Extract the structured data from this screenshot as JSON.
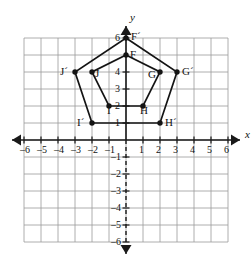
{
  "chart_data": {
    "type": "scatter",
    "title": "",
    "xlabel": "x",
    "ylabel": "y",
    "xlim": [
      -6,
      6
    ],
    "ylim": [
      -6,
      6
    ],
    "grid": true,
    "legend": "none",
    "x_ticks": [
      -6,
      -5,
      -4,
      -3,
      -2,
      -1,
      1,
      2,
      3,
      4,
      5,
      6
    ],
    "y_ticks": [
      6,
      4,
      3,
      2,
      1,
      -1,
      -2,
      -3,
      -4,
      -5,
      -6
    ],
    "x_tick_labels": [
      "-6",
      "-5",
      "-4",
      "-3",
      "-2",
      "-1",
      "1",
      "2",
      "3",
      "4",
      "5",
      "6"
    ],
    "y_tick_labels": [
      "6",
      "4",
      "3",
      "2",
      "1",
      "-1",
      "-2",
      "-3",
      "-4",
      "-5",
      "-6"
    ],
    "series": [
      {
        "name": "FGHIJ",
        "closed": true,
        "points": [
          {
            "label": "F",
            "x": 0,
            "y": 5,
            "label_dx": 4,
            "label_dy": -1
          },
          {
            "label": "G",
            "x": 2,
            "y": 4,
            "label_dx": -12,
            "label_dy": 2
          },
          {
            "label": "H",
            "x": 1,
            "y": 2,
            "label_dx": -3,
            "label_dy": 4
          },
          {
            "label": "I",
            "x": -1,
            "y": 2,
            "label_dx": -2,
            "label_dy": 4
          },
          {
            "label": "J",
            "x": -2,
            "y": 4,
            "label_dx": 3,
            "label_dy": 1
          }
        ]
      },
      {
        "name": "F'G'H'I'J'",
        "closed": true,
        "points": [
          {
            "label": "F´",
            "x": 0,
            "y": 6,
            "label_dx": 5,
            "label_dy": -2
          },
          {
            "label": "G´",
            "x": 3,
            "y": 4,
            "label_dx": 5,
            "label_dy": -1
          },
          {
            "label": "H´",
            "x": 2,
            "y": 1,
            "label_dx": 5,
            "label_dy": -1
          },
          {
            "label": "I´",
            "x": -2,
            "y": 1,
            "label_dx": -15,
            "label_dy": -1
          },
          {
            "label": "J´",
            "x": -3,
            "y": 4,
            "label_dx": -15,
            "label_dy": -1
          }
        ]
      }
    ],
    "colors": {
      "grid": "#9a9a9a",
      "axis": "#1a1a1a",
      "shape": "#141414",
      "vertex": "#141414",
      "background": "#ffffff"
    }
  },
  "geometry": {
    "origin_x": 126,
    "origin_y": 140,
    "unit": 17.0,
    "grid_min": -6,
    "grid_max": 6
  }
}
